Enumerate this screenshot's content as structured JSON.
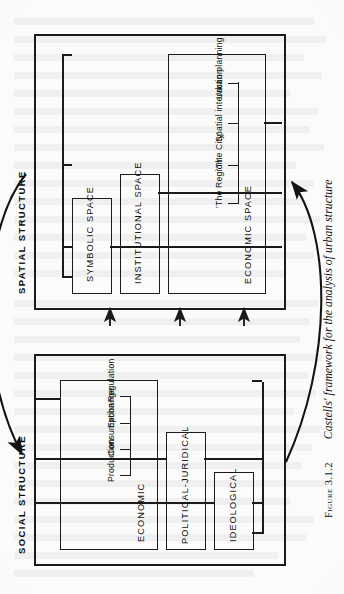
{
  "figure": {
    "number_label": "Figure 3.1.2",
    "caption": "Castells' framework for the analysis of urban structure"
  },
  "diagram": {
    "type": "block-diagram",
    "orientation": "rotated-90-ccw-on-page",
    "blocks": [
      {
        "id": "spatial-structure",
        "label": "SPATIAL STRUCTURE",
        "children": [
          {
            "id": "symbolic-space",
            "label": "SYMBOLIC SPACE",
            "items": []
          },
          {
            "id": "institutional-space",
            "label": "INSTITUTIONAL SPACE",
            "items": []
          },
          {
            "id": "economic-space",
            "label": "ECONOMIC SPACE",
            "items": [
              "'The Region'",
              "'The City'",
              "Spatial interaction",
              "Urban planning"
            ]
          }
        ]
      },
      {
        "id": "social-structure",
        "label": "SOCIAL STRUCTURE",
        "children": [
          {
            "id": "ideological",
            "label": "IDEOLOGICAL",
            "items": []
          },
          {
            "id": "political-juridical",
            "label": "POLITICAL-JURIDICAL",
            "items": []
          },
          {
            "id": "economic",
            "label": "ECONOMIC",
            "items": [
              "Production",
              "Consumption",
              "Exchange",
              "Regulation"
            ]
          }
        ]
      }
    ],
    "connectors": {
      "vertical_arrows_count": 3,
      "vertical_arrow_direction": "social-to-spatial",
      "curve_left_direction": "social-to-spatial",
      "curve_right_direction": "spatial-to-social"
    },
    "colors": {
      "ink": "#1b1b1b",
      "paper": "#fbfbfa"
    }
  }
}
